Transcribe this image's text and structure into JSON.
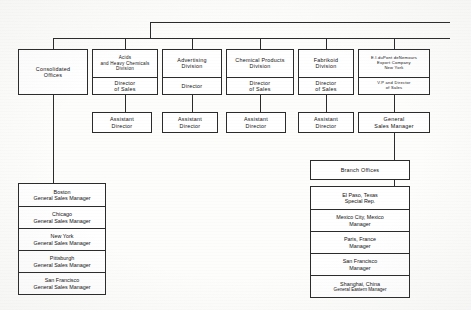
{
  "chart_title": "DuPont Sales Organization Chart",
  "top_row": [
    {
      "id": "consolidated-offices",
      "header": [
        "Consolidated",
        "Offices"
      ],
      "role": []
    },
    {
      "id": "acids-and-heavy-chemicals-division",
      "header": [
        "Acids",
        "and Heavy Chemicals",
        "Division"
      ],
      "role": [
        "Director",
        "of Sales"
      ]
    },
    {
      "id": "advertising-division",
      "header": [
        "Advertising",
        "Division"
      ],
      "role": [
        "Director"
      ]
    },
    {
      "id": "chemical-products-division",
      "header": [
        "Chemical Products",
        "Division"
      ],
      "role": [
        "Director",
        "of Sales"
      ]
    },
    {
      "id": "fabrikoid-division",
      "header": [
        "Fabrikoid",
        "Division"
      ],
      "role": [
        "Director",
        "of Sales"
      ]
    },
    {
      "id": "export-company",
      "header": [
        "E.I.duPont deNemours",
        "Export Company",
        "New York"
      ],
      "role": [
        "V.P and Director",
        "of Sales"
      ]
    }
  ],
  "second_row": [
    {
      "id": "assistant-director-acids",
      "lines": [
        "Assistant",
        "Director"
      ]
    },
    {
      "id": "assistant-director-advertising",
      "lines": [
        "Assistant",
        "Director"
      ]
    },
    {
      "id": "assistant-director-chemical-products",
      "lines": [
        "Assistant",
        "Director"
      ]
    },
    {
      "id": "assistant-director-fabrikoid",
      "lines": [
        "Assistant",
        "Director"
      ]
    },
    {
      "id": "general-sales-manager-export",
      "lines": [
        "General",
        "Sales Manager"
      ]
    }
  ],
  "consolidated_offices_list": {
    "id": "consolidated-offices-list",
    "items": [
      {
        "city": "Boston",
        "title": "General Sales Manager"
      },
      {
        "city": "Chicago",
        "title": "General Sales Manager"
      },
      {
        "city": "New York",
        "title": "General Sales Manager"
      },
      {
        "city": "Pittsburgh",
        "title": "General Sales Manager"
      },
      {
        "city": "San Francisco",
        "title": "General Sales Manager"
      }
    ]
  },
  "branch_offices": {
    "id": "branch-offices",
    "heading": "Branch Offices",
    "items": [
      {
        "city": "El Paso, Texas",
        "title": "Special Rep."
      },
      {
        "city": "Mexico City, Mexico",
        "title": "Manager"
      },
      {
        "city": "Paris, France",
        "title": "Manager"
      },
      {
        "city": "San Francisco",
        "title": "Manager"
      },
      {
        "city": "Shanghai, China",
        "title": "General Eastern Manager"
      }
    ]
  },
  "colors": {
    "ink": "#2b2b2b",
    "paper": "#fdfdfc"
  }
}
